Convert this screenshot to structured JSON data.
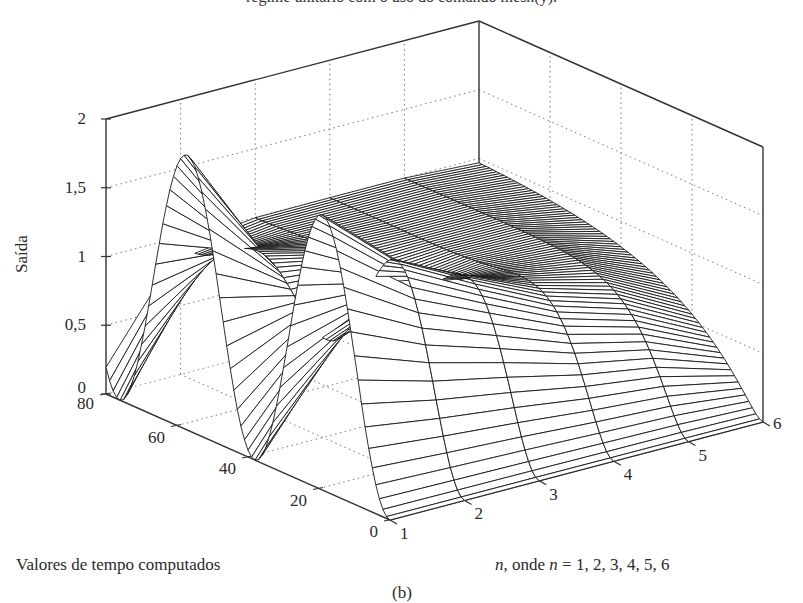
{
  "caption_top": "regime unitário com o uso do comando mesh(y).",
  "chart_data": {
    "type": "surface-mesh",
    "title": "",
    "zlabel": "Saída",
    "tlabel": "Valores de tempo computados",
    "nlabel_prefix": "n",
    "nlabel_mid": ", onde ",
    "nlabel_var": "n",
    "nlabel_suffix": " = 1, 2, 3, 4, 5, 6",
    "subfigure_label": "(b)",
    "z_ticks": [
      "0",
      "0,5",
      "1",
      "1,5",
      "2"
    ],
    "z_tick_values": [
      0,
      0.5,
      1,
      1.5,
      2
    ],
    "t_ticks": [
      "0",
      "20",
      "40",
      "60",
      "80"
    ],
    "t_tick_values": [
      0,
      20,
      40,
      60,
      80
    ],
    "n_ticks": [
      "1",
      "2",
      "3",
      "4",
      "5",
      "6"
    ],
    "n_tick_values": [
      1,
      2,
      3,
      4,
      5,
      6
    ],
    "zlim": [
      0,
      2
    ],
    "tlim": [
      0,
      80
    ],
    "nlim": [
      1,
      6
    ],
    "grid": true,
    "series": [
      {
        "name": "n=1",
        "damping_ratio": 0.0,
        "peak": 2.0,
        "settles_at": null
      },
      {
        "name": "n=2",
        "damping_ratio": 0.2,
        "peak": 1.5,
        "settles_at": 1
      },
      {
        "name": "n=3",
        "damping_ratio": 0.4,
        "peak": 1.25,
        "settles_at": 1
      },
      {
        "name": "n=4",
        "damping_ratio": 0.7,
        "peak": 1.05,
        "settles_at": 1
      },
      {
        "name": "n=5",
        "damping_ratio": 1.0,
        "peak": 1.0,
        "settles_at": 1
      },
      {
        "name": "n=6",
        "damping_ratio": 2.0,
        "peak": 1.0,
        "settles_at": 1
      }
    ],
    "samples": 81,
    "omega": 0.165
  }
}
